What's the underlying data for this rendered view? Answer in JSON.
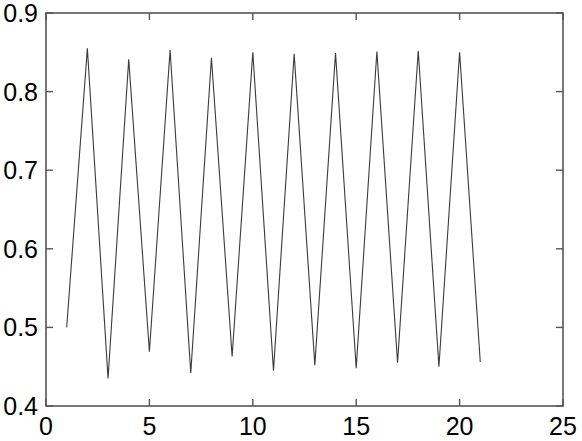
{
  "chart_data": {
    "type": "line",
    "title": "",
    "xlabel": "",
    "ylabel": "",
    "xlim": [
      0,
      25
    ],
    "ylim": [
      0.4,
      0.9
    ],
    "grid": false,
    "legend": null,
    "xticks": [
      0,
      5,
      10,
      15,
      20,
      25
    ],
    "xtick_labels": [
      "0",
      "5",
      "10",
      "15",
      "20",
      "25"
    ],
    "yticks": [
      0.4,
      0.5,
      0.6,
      0.7,
      0.8,
      0.9
    ],
    "ytick_labels": [
      "0.4",
      "0.5",
      "0.6",
      "0.7",
      "0.8",
      "0.9"
    ],
    "line_color": "#3a3a3a",
    "line_width": 1.1,
    "series": [
      {
        "name": "oscillation",
        "x": [
          1,
          2,
          3,
          4,
          5,
          6,
          7,
          8,
          9,
          10,
          11,
          12,
          13,
          14,
          15,
          16,
          17,
          18,
          19,
          20,
          21
        ],
        "y": [
          0.5,
          0.855,
          0.435,
          0.841,
          0.469,
          0.853,
          0.442,
          0.843,
          0.463,
          0.85,
          0.445,
          0.848,
          0.452,
          0.849,
          0.448,
          0.851,
          0.455,
          0.852,
          0.45,
          0.85,
          0.456
        ]
      }
    ]
  },
  "axes": {
    "box": true,
    "box_color": "#555555",
    "tick_direction": "in"
  }
}
